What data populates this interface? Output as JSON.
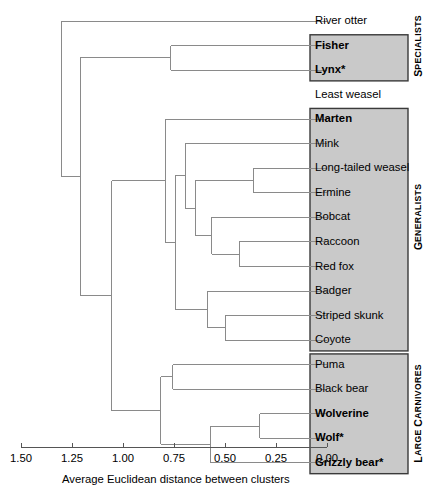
{
  "figure": {
    "type": "dendrogram",
    "axis": {
      "title": "Average Euclidean distance between clusters",
      "ticks": [
        "1.50",
        "1.25",
        "1.00",
        "0.75",
        "0.50",
        "0.25",
        "0.00"
      ],
      "tick_values": [
        1.5,
        1.25,
        1.0,
        0.75,
        0.5,
        0.25,
        0.0
      ],
      "min": 0.0,
      "max": 1.5,
      "direction": "reversed"
    },
    "colors": {
      "box_fill": "#c9c9c9",
      "box_stroke": "#3a3a3a",
      "line": "#8a8a8a",
      "text": "#000000"
    },
    "leaves": [
      {
        "name": "River otter",
        "bold": false,
        "boxed": false,
        "group": "SPECIALISTS"
      },
      {
        "name": "Fisher",
        "bold": true,
        "boxed": true,
        "group": "SPECIALISTS"
      },
      {
        "name": "Lynx*",
        "bold": true,
        "boxed": true,
        "group": "SPECIALISTS"
      },
      {
        "name": "Least weasel",
        "bold": false,
        "boxed": false,
        "group": "GENERALISTS"
      },
      {
        "name": "Marten",
        "bold": true,
        "boxed": true,
        "group": "GENERALISTS"
      },
      {
        "name": "Mink",
        "bold": false,
        "boxed": true,
        "group": "GENERALISTS"
      },
      {
        "name": "Long-tailed weasel",
        "bold": false,
        "boxed": true,
        "group": "GENERALISTS"
      },
      {
        "name": "Ermine",
        "bold": false,
        "boxed": true,
        "group": "GENERALISTS"
      },
      {
        "name": "Bobcat",
        "bold": false,
        "boxed": true,
        "group": "GENERALISTS"
      },
      {
        "name": "Raccoon",
        "bold": false,
        "boxed": true,
        "group": "GENERALISTS"
      },
      {
        "name": "Red fox",
        "bold": false,
        "boxed": true,
        "group": "GENERALISTS"
      },
      {
        "name": "Badger",
        "bold": false,
        "boxed": true,
        "group": "GENERALISTS"
      },
      {
        "name": "Striped skunk",
        "bold": false,
        "boxed": true,
        "group": "GENERALISTS"
      },
      {
        "name": "Coyote",
        "bold": false,
        "boxed": true,
        "group": "GENERALISTS"
      },
      {
        "name": "Puma",
        "bold": false,
        "boxed": true,
        "group": "LARGE CARNIVORES"
      },
      {
        "name": "Black bear",
        "bold": false,
        "boxed": true,
        "group": "LARGE CARNIVORES"
      },
      {
        "name": "Wolverine",
        "bold": true,
        "boxed": true,
        "group": "LARGE CARNIVORES"
      },
      {
        "name": "Wolf*",
        "bold": true,
        "boxed": true,
        "group": "LARGE CARNIVORES"
      },
      {
        "name": "Grizzly bear*",
        "bold": true,
        "boxed": true,
        "group": "LARGE CARNIVORES"
      }
    ],
    "group_labels": [
      {
        "text": "SPECIALISTS",
        "first_leaf": 0,
        "last_leaf": 2
      },
      {
        "text": "GENERALISTS",
        "first_leaf": 3,
        "last_leaf": 13
      },
      {
        "text": "LARGE CARNIVORES",
        "first_leaf": 14,
        "last_leaf": 18
      }
    ],
    "boxes": [
      {
        "group": "SPECIALISTS",
        "from_leaf": 1,
        "to_leaf": 2
      },
      {
        "group": "GENERALISTS",
        "from_leaf": 4,
        "to_leaf": 13
      },
      {
        "group": "LARGE CARNIVORES",
        "from_leaf": 14,
        "to_leaf": 18
      }
    ],
    "merges": [
      {
        "id": "m1",
        "left": "leaf:6",
        "right": "leaf:7",
        "height": 0.36
      },
      {
        "id": "m2",
        "left": "leaf:9",
        "right": "leaf:10",
        "height": 0.43
      },
      {
        "id": "m3",
        "left": "leaf:8",
        "right": "m2",
        "height": 0.565
      },
      {
        "id": "m4",
        "left": "m1",
        "right": "m3",
        "height": 0.645
      },
      {
        "id": "m5",
        "left": "leaf:5",
        "right": "m4",
        "height": 0.695
      },
      {
        "id": "m6",
        "left": "leaf:12",
        "right": "leaf:13",
        "height": 0.5
      },
      {
        "id": "m7",
        "left": "leaf:11",
        "right": "m6",
        "height": 0.585
      },
      {
        "id": "m8",
        "left": "m5",
        "right": "m7",
        "height": 0.745
      },
      {
        "id": "m9",
        "left": "leaf:4",
        "right": "m8",
        "height": 0.79
      },
      {
        "id": "m10",
        "left": "leaf:1",
        "right": "leaf:2",
        "height": 0.765
      },
      {
        "id": "m11",
        "left": "leaf:16",
        "right": "leaf:17",
        "height": 0.33
      },
      {
        "id": "m12",
        "left": "m11",
        "right": "leaf:18",
        "height": 0.57
      },
      {
        "id": "m13",
        "left": "leaf:14",
        "right": "leaf:15",
        "height": 0.755
      },
      {
        "id": "m14",
        "left": "m13",
        "right": "m12",
        "height": 0.815
      },
      {
        "id": "m15",
        "left": "m9",
        "right": "m14",
        "height": 1.055
      },
      {
        "id": "m16",
        "left": "m10",
        "right": "m15",
        "height": 1.21
      },
      {
        "id": "m17",
        "left": "leaf:0",
        "right": "m16",
        "height": 1.3
      }
    ]
  }
}
